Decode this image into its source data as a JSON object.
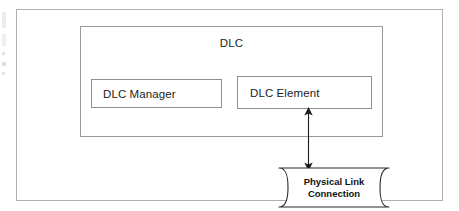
{
  "diagram": {
    "container": {
      "label": "DLC",
      "name": "dlc-container"
    },
    "blocks": [
      {
        "id": "dlc-manager",
        "label": "DLC Manager"
      },
      {
        "id": "dlc-element",
        "label": "DLC Element"
      }
    ],
    "external_node": {
      "id": "physical-link-connection",
      "label_line1": "Physical Link",
      "label_line2": "Connection",
      "shape": "ribbon"
    },
    "connector": {
      "id": "dlc-element-to-physical-link",
      "type": "double-headed-arrow",
      "direction": "vertical",
      "from": "DLC Element",
      "to": "Physical Link Connection"
    },
    "colors": {
      "background": "#ffffff",
      "outer_border": "#b0b0b0",
      "container_border": "#9a9a9a",
      "box_border": "#8e8e8e",
      "line": "#1a1a1a",
      "text": "#1d1d1d"
    }
  }
}
